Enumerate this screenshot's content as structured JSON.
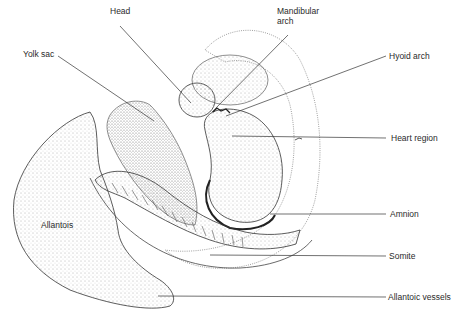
{
  "diagram": {
    "colors": {
      "ink": "#2a2a2a",
      "stipple": "#555555",
      "background": "#ffffff"
    },
    "labels": [
      {
        "id": "head",
        "text": "Head",
        "x": 110,
        "y": 11
      },
      {
        "id": "mandibular-arch",
        "text": "Mandibular\narch",
        "line1": "Mandibular",
        "line2": "arch",
        "x": 277,
        "y": 11
      },
      {
        "id": "yolk-sac",
        "text": "Yolk sac",
        "x": 23,
        "y": 49
      },
      {
        "id": "hyoid-arch",
        "text": "Hyoid arch",
        "x": 389,
        "y": 50
      },
      {
        "id": "heart-region",
        "text": "Heart region",
        "x": 391,
        "y": 133
      },
      {
        "id": "amnion",
        "text": "Amnion",
        "x": 390,
        "y": 210
      },
      {
        "id": "allantois",
        "text": "Allantois",
        "x": 41,
        "y": 220
      },
      {
        "id": "somite",
        "text": "Somite",
        "x": 389,
        "y": 251
      },
      {
        "id": "allantoic-vessels",
        "text": "Allantoic vessels",
        "x": 388,
        "y": 292
      }
    ]
  }
}
